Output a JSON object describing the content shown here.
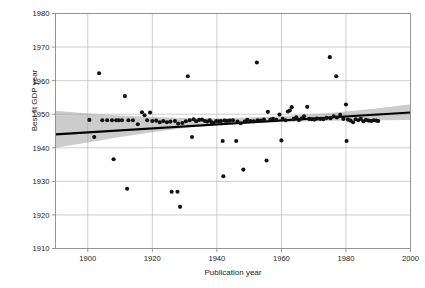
{
  "chart_data": {
    "type": "scatter",
    "title": "",
    "xlabel": "Publication year",
    "ylabel": "Best fit GDP year",
    "xlim": [
      1890,
      2000
    ],
    "ylim": [
      1910,
      1980
    ],
    "xticks": [
      1900,
      1920,
      1940,
      1960,
      1980,
      2000
    ],
    "yticks": [
      1910,
      1920,
      1930,
      1940,
      1950,
      1960,
      1970,
      1980
    ],
    "grid": true,
    "legend": "none",
    "marker_color": "#111111",
    "line_color": "#000000",
    "band_color": "#9e9e9e",
    "fit_line": {
      "x": [
        1890,
        2000
      ],
      "y": [
        1944.0,
        1950.5
      ]
    },
    "confidence_band": {
      "x": [
        1890,
        1900,
        1910,
        1920,
        1930,
        1940,
        1950,
        1960,
        1970,
        1980,
        1990,
        2000
      ],
      "upper": [
        1951.0,
        1950.2,
        1949.6,
        1949.2,
        1948.9,
        1948.8,
        1949.0,
        1949.4,
        1950.0,
        1950.8,
        1951.8,
        1953.0
      ],
      "lower": [
        1940.0,
        1941.6,
        1943.2,
        1944.6,
        1945.9,
        1946.8,
        1947.3,
        1947.6,
        1947.9,
        1948.1,
        1948.2,
        1948.3
      ]
    },
    "points": [
      {
        "x": 1900.5,
        "y": 1948.3
      },
      {
        "x": 1902.0,
        "y": 1943.2
      },
      {
        "x": 1903.5,
        "y": 1962.2
      },
      {
        "x": 1904.5,
        "y": 1948.2
      },
      {
        "x": 1906.0,
        "y": 1948.2
      },
      {
        "x": 1907.5,
        "y": 1948.2
      },
      {
        "x": 1908.0,
        "y": 1936.6
      },
      {
        "x": 1908.8,
        "y": 1948.2
      },
      {
        "x": 1909.6,
        "y": 1948.2
      },
      {
        "x": 1910.6,
        "y": 1948.2
      },
      {
        "x": 1911.5,
        "y": 1955.4
      },
      {
        "x": 1912.2,
        "y": 1927.8
      },
      {
        "x": 1912.6,
        "y": 1948.2
      },
      {
        "x": 1914.0,
        "y": 1948.2
      },
      {
        "x": 1915.5,
        "y": 1947.0
      },
      {
        "x": 1916.8,
        "y": 1950.6
      },
      {
        "x": 1917.6,
        "y": 1949.7
      },
      {
        "x": 1918.4,
        "y": 1948.2
      },
      {
        "x": 1919.3,
        "y": 1950.5
      },
      {
        "x": 1920.0,
        "y": 1948.0
      },
      {
        "x": 1921.2,
        "y": 1948.1
      },
      {
        "x": 1922.3,
        "y": 1947.6
      },
      {
        "x": 1923.4,
        "y": 1948.0
      },
      {
        "x": 1924.5,
        "y": 1947.6
      },
      {
        "x": 1925.6,
        "y": 1947.8
      },
      {
        "x": 1926.0,
        "y": 1926.9
      },
      {
        "x": 1927.0,
        "y": 1948.0
      },
      {
        "x": 1927.8,
        "y": 1926.9
      },
      {
        "x": 1928.0,
        "y": 1947.2
      },
      {
        "x": 1928.6,
        "y": 1922.4
      },
      {
        "x": 1929.3,
        "y": 1947.4
      },
      {
        "x": 1930.4,
        "y": 1947.9
      },
      {
        "x": 1931.0,
        "y": 1961.3
      },
      {
        "x": 1931.6,
        "y": 1948.2
      },
      {
        "x": 1932.3,
        "y": 1943.2
      },
      {
        "x": 1932.8,
        "y": 1948.5
      },
      {
        "x": 1933.6,
        "y": 1947.9
      },
      {
        "x": 1934.5,
        "y": 1948.3
      },
      {
        "x": 1935.4,
        "y": 1948.4
      },
      {
        "x": 1936.3,
        "y": 1948.0
      },
      {
        "x": 1937.0,
        "y": 1947.8
      },
      {
        "x": 1937.8,
        "y": 1948.2
      },
      {
        "x": 1938.4,
        "y": 1947.6
      },
      {
        "x": 1939.0,
        "y": 1947.4
      },
      {
        "x": 1939.8,
        "y": 1948.0
      },
      {
        "x": 1940.6,
        "y": 1947.9
      },
      {
        "x": 1941.3,
        "y": 1948.0
      },
      {
        "x": 1941.8,
        "y": 1942.0
      },
      {
        "x": 1942.0,
        "y": 1931.5
      },
      {
        "x": 1942.4,
        "y": 1948.1
      },
      {
        "x": 1943.2,
        "y": 1948.0
      },
      {
        "x": 1944.0,
        "y": 1948.1
      },
      {
        "x": 1945.0,
        "y": 1948.2
      },
      {
        "x": 1946.0,
        "y": 1942.0
      },
      {
        "x": 1946.4,
        "y": 1947.8
      },
      {
        "x": 1947.4,
        "y": 1947.3
      },
      {
        "x": 1948.2,
        "y": 1933.5
      },
      {
        "x": 1948.6,
        "y": 1947.8
      },
      {
        "x": 1949.4,
        "y": 1948.3
      },
      {
        "x": 1950.4,
        "y": 1948.0
      },
      {
        "x": 1951.4,
        "y": 1947.9
      },
      {
        "x": 1952.4,
        "y": 1965.4
      },
      {
        "x": 1952.6,
        "y": 1948.2
      },
      {
        "x": 1953.6,
        "y": 1948.1
      },
      {
        "x": 1954.6,
        "y": 1948.4
      },
      {
        "x": 1955.4,
        "y": 1936.2
      },
      {
        "x": 1955.8,
        "y": 1950.7
      },
      {
        "x": 1956.6,
        "y": 1948.4
      },
      {
        "x": 1957.4,
        "y": 1948.6
      },
      {
        "x": 1958.4,
        "y": 1948.3
      },
      {
        "x": 1959.4,
        "y": 1949.9
      },
      {
        "x": 1960.0,
        "y": 1942.2
      },
      {
        "x": 1960.4,
        "y": 1948.6
      },
      {
        "x": 1961.3,
        "y": 1948.2
      },
      {
        "x": 1962.0,
        "y": 1950.8
      },
      {
        "x": 1962.6,
        "y": 1951.1
      },
      {
        "x": 1963.2,
        "y": 1952.1
      },
      {
        "x": 1963.8,
        "y": 1948.6
      },
      {
        "x": 1964.6,
        "y": 1949.1
      },
      {
        "x": 1965.4,
        "y": 1948.3
      },
      {
        "x": 1966.2,
        "y": 1948.7
      },
      {
        "x": 1967.0,
        "y": 1949.4
      },
      {
        "x": 1968.0,
        "y": 1952.2
      },
      {
        "x": 1968.6,
        "y": 1948.6
      },
      {
        "x": 1969.4,
        "y": 1948.5
      },
      {
        "x": 1970.2,
        "y": 1948.4
      },
      {
        "x": 1971.0,
        "y": 1948.7
      },
      {
        "x": 1972.0,
        "y": 1948.6
      },
      {
        "x": 1973.0,
        "y": 1948.5
      },
      {
        "x": 1974.0,
        "y": 1948.9
      },
      {
        "x": 1975.0,
        "y": 1967.0
      },
      {
        "x": 1975.2,
        "y": 1948.8
      },
      {
        "x": 1976.2,
        "y": 1949.4
      },
      {
        "x": 1977.0,
        "y": 1961.3
      },
      {
        "x": 1977.2,
        "y": 1949.0
      },
      {
        "x": 1978.2,
        "y": 1949.8
      },
      {
        "x": 1979.2,
        "y": 1948.6
      },
      {
        "x": 1980.0,
        "y": 1952.9
      },
      {
        "x": 1980.2,
        "y": 1942.0
      },
      {
        "x": 1980.6,
        "y": 1948.4
      },
      {
        "x": 1981.4,
        "y": 1948.1
      },
      {
        "x": 1982.2,
        "y": 1947.6
      },
      {
        "x": 1983.0,
        "y": 1948.5
      },
      {
        "x": 1983.8,
        "y": 1948.2
      },
      {
        "x": 1984.6,
        "y": 1948.6
      },
      {
        "x": 1985.4,
        "y": 1947.9
      },
      {
        "x": 1986.2,
        "y": 1948.3
      },
      {
        "x": 1987.0,
        "y": 1948.1
      },
      {
        "x": 1987.8,
        "y": 1948.0
      },
      {
        "x": 1988.6,
        "y": 1948.2
      },
      {
        "x": 1989.4,
        "y": 1948.1
      },
      {
        "x": 1990.0,
        "y": 1948.0
      }
    ]
  },
  "axis": {
    "xlabel": "Publication year",
    "ylabel": "Best fit GDP year",
    "xticklabels": [
      "1900",
      "1920",
      "1940",
      "1960",
      "1980",
      "2000"
    ],
    "yticklabels": [
      "1910",
      "1920",
      "1930",
      "1940",
      "1950",
      "1960",
      "1970",
      "1980"
    ]
  }
}
